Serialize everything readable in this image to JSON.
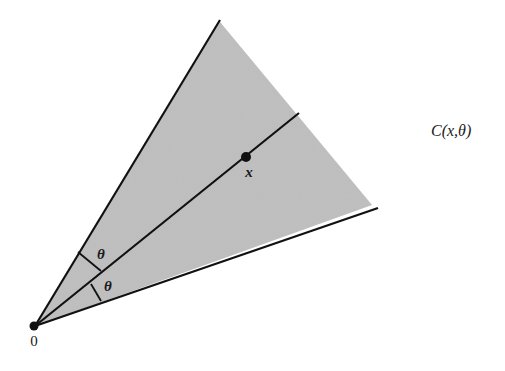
{
  "diagram": {
    "cone_label": "C(x,θ)",
    "origin_label": "0",
    "point_label": "x",
    "angle_labels": [
      "θ",
      "θ"
    ],
    "colors": {
      "shade": "#b8b8b8",
      "line": "#111111",
      "background": "#ffffff"
    },
    "geometry": {
      "origin": [
        35,
        326
      ],
      "upper_ray_end": [
        220,
        20
      ],
      "axis_ray_end": [
        299,
        113
      ],
      "lower_ray_end": [
        378,
        208
      ],
      "shade_far_edge": [
        [
          220,
          22
        ],
        [
          372,
          205
        ]
      ],
      "point_x": [
        246,
        157
      ]
    }
  }
}
